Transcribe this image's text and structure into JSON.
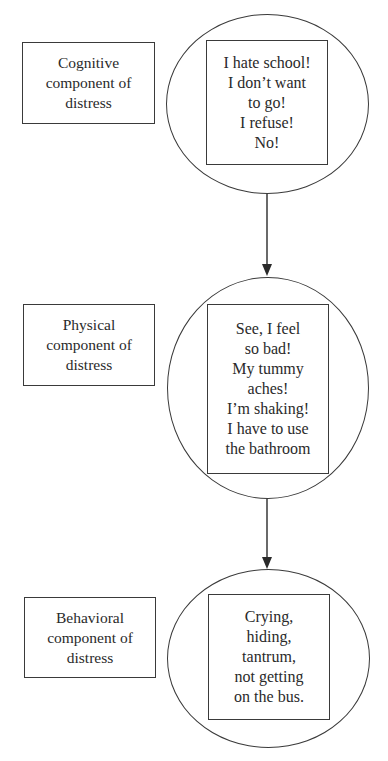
{
  "diagram": {
    "stages": [
      {
        "label_lines": [
          "Cognitive",
          "component of",
          "distress"
        ],
        "content_lines": [
          "I hate school!",
          "I don’t want",
          "to go!",
          "I refuse!",
          "No!"
        ]
      },
      {
        "label_lines": [
          "Physical",
          "component of",
          "distress"
        ],
        "content_lines": [
          "See, I feel",
          "so bad!",
          "My tummy",
          "aches!",
          "I’m shaking!",
          "I have to use",
          "the bathroom"
        ]
      },
      {
        "label_lines": [
          "Behavioral",
          "component of",
          "distress"
        ],
        "content_lines": [
          "Crying,",
          "hiding,",
          "tantrum,",
          "not getting",
          "on the bus."
        ]
      }
    ],
    "connectors": [
      {
        "from": "stage-1",
        "to": "stage-2",
        "type": "arrow-down"
      },
      {
        "from": "stage-2",
        "to": "stage-3",
        "type": "arrow-down"
      }
    ],
    "colors": {
      "stroke": "#3a3a3a",
      "text": "#2a2a2a",
      "background": "#ffffff"
    }
  }
}
